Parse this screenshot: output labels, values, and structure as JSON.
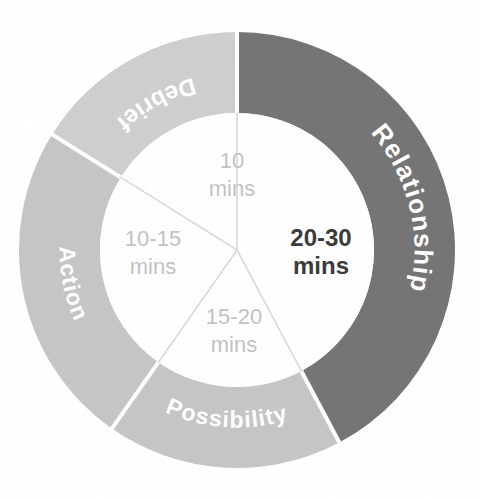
{
  "chart_data": {
    "type": "pie",
    "variant": "donut",
    "title": "",
    "subtitle": "",
    "xlabel": "",
    "ylabel": "",
    "legend": "none",
    "grid": false,
    "note": "Four-phase coaching conversation model; ring segment sizes are proportional to the time allotted to each phase.",
    "geometry": {
      "center_x": 237,
      "center_y": 250,
      "outer_radius": 218,
      "inner_radius": 137,
      "start_angle_deg": 0,
      "direction": "clockwise",
      "divider_color": "#ffffff",
      "divider_width": 4
    },
    "categories": [
      "Relationship",
      "Possibility",
      "Action",
      "Debrief"
    ],
    "values": [
      152,
      63,
      87,
      58
    ],
    "value_unit": "degrees of arc",
    "segments": [
      {
        "name": "Relationship",
        "label": "Relationship",
        "color": "#757575",
        "label_color": "#ffffff",
        "start_angle_deg": 0,
        "end_angle_deg": 152,
        "sweep_deg": 152,
        "percent": 42,
        "duration_label_line1": "20-30",
        "duration_label_line2": "mins",
        "duration_min": 20,
        "duration_max": 30,
        "emphasis": true
      },
      {
        "name": "Possibility",
        "label": "Possibility",
        "color": "#c6c6c6",
        "label_color": "#ffffff",
        "start_angle_deg": 152,
        "end_angle_deg": 215,
        "sweep_deg": 63,
        "percent": 17,
        "duration_label_line1": "15-20",
        "duration_label_line2": "mins",
        "duration_min": 15,
        "duration_max": 20,
        "emphasis": false
      },
      {
        "name": "Action",
        "label": "Action",
        "color": "#c6c6c6",
        "label_color": "#ffffff",
        "start_angle_deg": 215,
        "end_angle_deg": 302,
        "sweep_deg": 87,
        "percent": 24,
        "duration_label_line1": "10-15",
        "duration_label_line2": "mins",
        "duration_min": 10,
        "duration_max": 15,
        "emphasis": false
      },
      {
        "name": "Debrief",
        "label": "Debrief",
        "color": "#cfcfcf",
        "label_color": "#ffffff",
        "start_angle_deg": 302,
        "end_angle_deg": 360,
        "sweep_deg": 58,
        "percent": 16,
        "duration_label_line1": "10",
        "duration_label_line2": "mins",
        "duration_min": 10,
        "duration_max": 10,
        "emphasis": false
      }
    ],
    "hub": {
      "fill": "#ffffff",
      "spoke_color": "#dadada",
      "spoke_width": 1.6,
      "text_color_default": "#c3c3c3",
      "text_color_emphasis": "#3b3b3b"
    }
  },
  "colors": {
    "background": "#ffffff",
    "ring_dark": "#757575",
    "ring_light": "#c6c6c6",
    "ring_lighter": "#cfcfcf",
    "divider": "#ffffff",
    "hub_text_muted": "#c3c3c3",
    "hub_text_strong": "#3b3b3b",
    "spoke": "#dadada"
  }
}
